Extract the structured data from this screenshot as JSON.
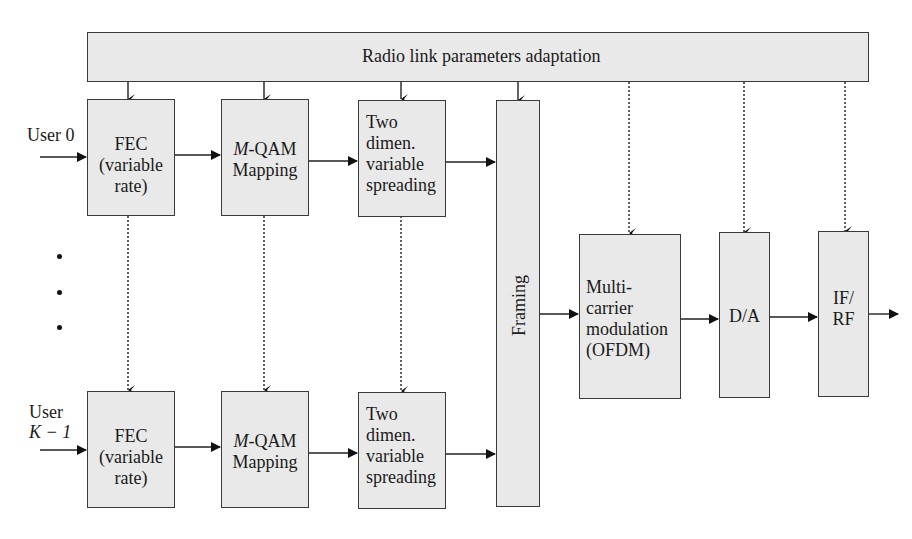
{
  "diagram": {
    "top_bar": {
      "label": "Radio link parameters adaptation"
    },
    "users": [
      {
        "label_line1": "User 0",
        "label_line2": ""
      },
      {
        "label_line1": "User",
        "label_line2": "K − 1"
      }
    ],
    "ellipsis_dots": 3,
    "rows": [
      {
        "fec": [
          "FEC",
          "(variable",
          "rate)"
        ],
        "qam": {
          "italic": "M",
          "rest": "-QAM",
          "line2": "Mapping"
        },
        "spread": [
          "Two",
          "dimen.",
          "variable",
          "spreading"
        ]
      },
      {
        "fec": [
          "FEC",
          "(variable",
          "rate)"
        ],
        "qam": {
          "italic": "M",
          "rest": "-QAM",
          "line2": "Mapping"
        },
        "spread": [
          "Two",
          "dimen.",
          "variable",
          "spreading"
        ]
      }
    ],
    "framing": {
      "label": "Framing"
    },
    "ofdm": [
      "Multi-",
      "carrier",
      "modulation",
      "(OFDM)"
    ],
    "da": {
      "label": "D/A"
    },
    "ifrf": [
      "IF/",
      "RF"
    ],
    "colors": {
      "block_fill": "#e9e9e9",
      "stroke": "#3a3a3a"
    }
  }
}
